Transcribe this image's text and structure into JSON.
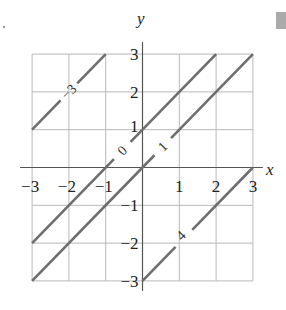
{
  "chart_data": {
    "type": "line",
    "title": "",
    "xlabel": "x",
    "ylabel": "y",
    "xlim": [
      -3,
      3
    ],
    "ylim": [
      -3,
      3
    ],
    "grid": true,
    "x_ticks": [
      "-3",
      "-2",
      "-1",
      "1",
      "2",
      "3"
    ],
    "y_ticks": [
      "3",
      "2",
      "1",
      "-1",
      "-2",
      "-3"
    ],
    "series": [
      {
        "name": "-3",
        "label": "-3",
        "points": [
          [
            -3,
            1
          ],
          [
            -1,
            3
          ]
        ],
        "label_at": [
          -2,
          2
        ]
      },
      {
        "name": "0",
        "label": "0",
        "points": [
          [
            -3,
            -2
          ],
          [
            2,
            3
          ]
        ],
        "label_at": [
          -0.55,
          0.45
        ]
      },
      {
        "name": "1",
        "label": "1",
        "points": [
          [
            -3,
            -3
          ],
          [
            3,
            3
          ]
        ],
        "label_at": [
          0.55,
          0.55
        ]
      },
      {
        "name": "4",
        "label": "4",
        "points": [
          [
            0,
            -3
          ],
          [
            3,
            0
          ]
        ],
        "label_at": [
          1.05,
          -1.8
        ]
      }
    ],
    "colors": {
      "grid": "#b8b8b8",
      "axis": "#555555",
      "line": "#6e6e6e",
      "text": "#222222"
    },
    "annotations": [
      "corner dot at upper-left",
      "gray square at upper-right"
    ]
  }
}
